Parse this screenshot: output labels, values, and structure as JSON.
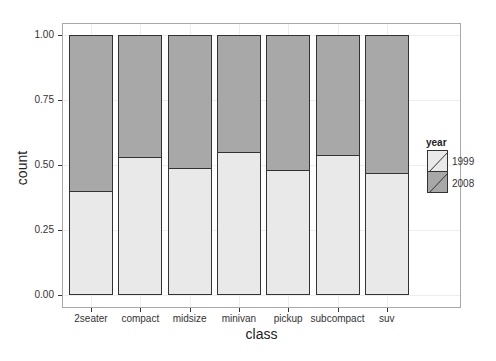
{
  "chart_data": {
    "type": "bar",
    "stacked": true,
    "position": "fill",
    "title": "",
    "xlabel": "class",
    "ylabel": "count",
    "ylim": [
      0,
      1
    ],
    "grid": true,
    "legend_position": "right",
    "categories": [
      "2seater",
      "compact",
      "midsize",
      "minivan",
      "pickup",
      "subcompact",
      "suv"
    ],
    "yticks": [
      "0.00",
      "0.25",
      "0.50",
      "0.75",
      "1.00"
    ],
    "series": [
      {
        "name": "1999",
        "color": "#e9e9e9",
        "values": [
          0.4,
          0.53,
          0.49,
          0.55,
          0.48,
          0.54,
          0.47
        ]
      },
      {
        "name": "2008",
        "color": "#a8a8a8",
        "values": [
          0.6,
          0.47,
          0.51,
          0.45,
          0.52,
          0.46,
          0.53
        ]
      }
    ],
    "legend": {
      "title": "year",
      "entries": [
        "1999",
        "2008"
      ]
    }
  },
  "axes": {
    "xlabel": "class",
    "ylabel": "count",
    "yticks": [
      "0.00",
      "0.25",
      "0.50",
      "0.75",
      "1.00"
    ],
    "xticks": [
      "2seater",
      "compact",
      "midsize",
      "minivan",
      "pickup",
      "subcompact",
      "suv"
    ]
  },
  "legend": {
    "title": "year",
    "items": [
      {
        "label": "1999",
        "color": "#e9e9e9"
      },
      {
        "label": "2008",
        "color": "#a8a8a8"
      }
    ]
  }
}
